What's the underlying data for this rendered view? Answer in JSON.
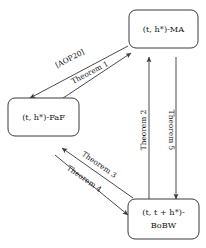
{
  "diagram": {
    "background_color": "#ffffff",
    "line_color": "#4a4a4a",
    "text_color": "#141414",
    "nodes": [
      {
        "id": "ma",
        "name": "node-ma",
        "line1_prefix": "(",
        "line1_t": "t",
        "line1_comma": ", ",
        "line1_h": "h",
        "line1_star": "*",
        "line1_suffix": ")-MA",
        "label_full": "(t, h*)-MA",
        "line2": ""
      },
      {
        "id": "faf",
        "name": "node-faf",
        "label_full": "(t, h*)-FaF",
        "line2": ""
      },
      {
        "id": "bobw",
        "name": "node-bobw",
        "label_full": "(t, t + h*)-",
        "line2": "BoBW"
      }
    ],
    "edges": [
      {
        "id": "aop20",
        "label": "[AOP20]",
        "from": "ma",
        "to": "faf"
      },
      {
        "id": "theorem1",
        "label": "Theorem 1",
        "from": "faf",
        "to": "ma"
      },
      {
        "id": "theorem2",
        "label": "Theorem 2",
        "from": "bobw",
        "to": "ma"
      },
      {
        "id": "theorem5",
        "label": "Theorem 5",
        "from": "ma",
        "to": "bobw"
      },
      {
        "id": "theorem3",
        "label": "Theorem 3",
        "from": "bobw",
        "to": "faf"
      },
      {
        "id": "theorem4",
        "label": "Theorem 4",
        "from": "faf",
        "to": "bobw"
      }
    ]
  }
}
